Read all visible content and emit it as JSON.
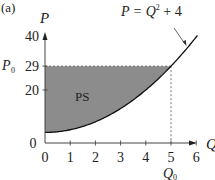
{
  "chart_data": {
    "type": "area",
    "panel_label": "(a)",
    "xlabel": "Q",
    "ylabel": "P",
    "xlim": [
      0,
      6
    ],
    "ylim": [
      0,
      40
    ],
    "xticks": [
      "0",
      "1",
      "2",
      "3",
      "4",
      "5",
      "6"
    ],
    "yticks": [
      "0",
      "20",
      "29",
      "40"
    ],
    "grid": false,
    "curve": {
      "name": "P = Q² + 4",
      "equation_label": "P = Q",
      "equation_exponent": "2",
      "equation_tail": " + 4",
      "x": [
        0,
        1,
        2,
        3,
        4,
        5,
        6
      ],
      "y": [
        4,
        5,
        8,
        13,
        20,
        29,
        40
      ]
    },
    "equilibrium": {
      "Q0": 5,
      "P0": 29,
      "q_label": "Q",
      "q_sub": "0",
      "p_label": "P",
      "p_sub": "0"
    },
    "shaded_region": {
      "label": "PS",
      "description": "Producer surplus: area between P0 = 29 and the supply curve for 0 ≤ Q ≤ 5",
      "color": "#8c8c8c"
    },
    "annotations": [
      "P = Q² + 4",
      "PS",
      "P₀",
      "Q₀"
    ]
  }
}
